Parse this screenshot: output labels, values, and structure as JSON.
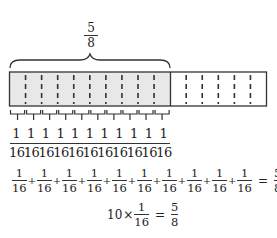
{
  "top_fraction": {
    "numerator": "5",
    "denominator": "8"
  },
  "bar": {
    "total_parts": 16,
    "shaded_parts": 10,
    "shaded_color": "#e8e8e8",
    "outline_color": "#333333"
  },
  "unit_labels": {
    "numerators": [
      "1",
      "1",
      "1",
      "1",
      "1",
      "1",
      "1",
      "1",
      "1",
      "1",
      "1"
    ],
    "denominators": [
      "16",
      "16",
      "16",
      "16",
      "16",
      "16",
      "16",
      "16",
      "16",
      "16",
      "16"
    ]
  },
  "sum_equation": {
    "terms": [
      {
        "n": "1",
        "d": "16"
      },
      {
        "n": "1",
        "d": "16"
      },
      {
        "n": "1",
        "d": "16"
      },
      {
        "n": "1",
        "d": "16"
      },
      {
        "n": "1",
        "d": "16"
      },
      {
        "n": "1",
        "d": "16"
      },
      {
        "n": "1",
        "d": "16"
      },
      {
        "n": "1",
        "d": "16"
      },
      {
        "n": "1",
        "d": "16"
      },
      {
        "n": "1",
        "d": "16"
      }
    ],
    "plus": "+",
    "equals": "=",
    "result": {
      "n": "5",
      "d": "8"
    }
  },
  "product_equation": {
    "multiplier": "10",
    "times": "×",
    "factor": {
      "n": "1",
      "d": "16"
    },
    "equals": "=",
    "result": {
      "n": "5",
      "d": "8"
    }
  }
}
